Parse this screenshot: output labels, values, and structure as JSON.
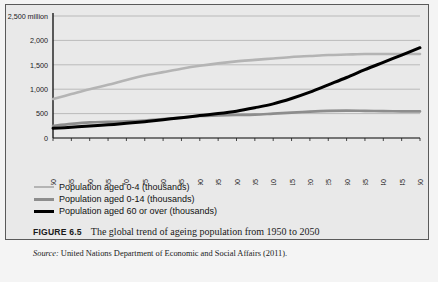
{
  "figure": {
    "number_label": "FIGURE 6.5",
    "caption": "The global trend of ageing population from 1950 to 2050",
    "source_label": "Source:",
    "source_text": "United Nations Department of Economic and Social Affairs (2011)."
  },
  "colors": {
    "series_0_4": "#b4b4b4",
    "series_0_14": "#8d8d8d",
    "series_60_plus": "#000000",
    "grid": "#9a9a9a",
    "axis": "#1a1a1a",
    "panel_background": "#e9e9e9",
    "page_background": "#f4f4f4",
    "frame_border": "#5a5a5a"
  },
  "chart_data": {
    "type": "line",
    "title": "",
    "xlabel": "",
    "ylabel": "",
    "y_unit_label": "2,500 million",
    "ylim": [
      0,
      2500
    ],
    "ytick_values": [
      0,
      500,
      1000,
      1500,
      2000,
      2500
    ],
    "ytick_labels": [
      "0",
      "500",
      "1,000",
      "1,500",
      "2,000",
      "2,500 million"
    ],
    "grid": true,
    "legend_position": "below-plot",
    "categories": [
      "1950",
      "1955",
      "1960",
      "1965",
      "1970",
      "1975",
      "1980",
      "1985",
      "1990",
      "1995",
      "2000",
      "2005",
      "2010",
      "2015",
      "2020",
      "2025",
      "2030",
      "2035",
      "2040",
      "2045",
      "2050"
    ],
    "series": [
      {
        "name": "Population aged 0-14 (thousands)",
        "color": "#b4b4b4",
        "values": [
          800,
          900,
          1000,
          1090,
          1190,
          1280,
          1350,
          1420,
          1480,
          1530,
          1570,
          1600,
          1630,
          1660,
          1680,
          1700,
          1710,
          1720,
          1720,
          1720,
          1720
        ]
      },
      {
        "name": "Population aged 0-4 (thousands)",
        "color": "#8d8d8d",
        "values": [
          250,
          290,
          320,
          330,
          340,
          360,
          390,
          420,
          450,
          460,
          470,
          480,
          500,
          520,
          540,
          555,
          560,
          555,
          550,
          545,
          545
        ]
      },
      {
        "name": "Population aged 60 or over (thousands)",
        "color": "#000000",
        "values": [
          200,
          220,
          245,
          270,
          300,
          335,
          375,
          415,
          460,
          500,
          550,
          620,
          700,
          810,
          940,
          1090,
          1240,
          1400,
          1550,
          1700,
          1850
        ]
      }
    ],
    "legend_order": [
      "Population aged 0-4 (thousands)",
      "Population aged 0-14 (thousands)",
      "Population aged 60 or over (thousands)"
    ]
  }
}
